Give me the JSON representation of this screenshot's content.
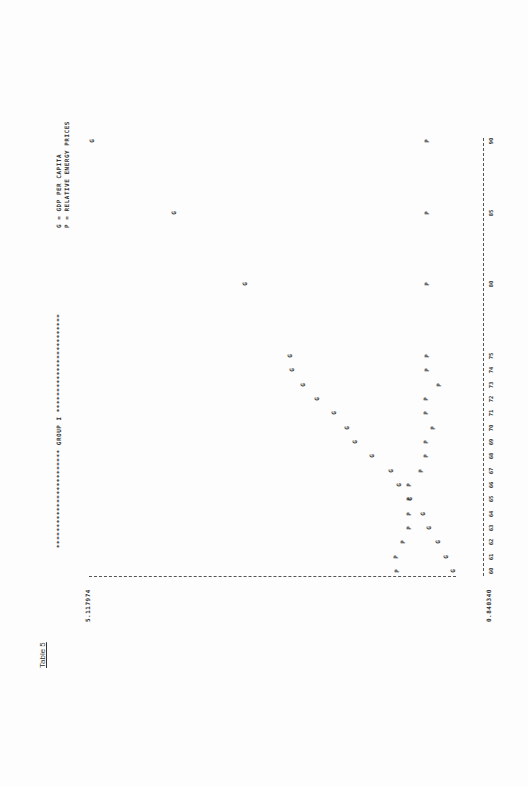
{
  "page": {
    "table_label": "Table 5",
    "banner": "************************ GROUP I ************************",
    "legend": [
      {
        "symbol": "G",
        "text": "G = GDP PER CAPITA"
      },
      {
        "symbol": "P",
        "text": "P = RELATIVE ENERGY PRICES"
      }
    ],
    "y_max_label": "5.117974",
    "y_min_label": "0.840340"
  },
  "chart_data": {
    "type": "scatter",
    "title": "GROUP I",
    "subtitle": "Table 5",
    "xlabel": "Year",
    "ylabel": "",
    "orientation": "rotated 90 degrees (line-printer plot)",
    "ylim": [
      0.84034,
      5.117974
    ],
    "x_tick_labels": [
      "60",
      "61",
      "62",
      "63",
      "64",
      "65",
      "66",
      "67",
      "68",
      "69",
      "70",
      "71",
      "72",
      "73",
      "74",
      "75",
      "80",
      "85",
      "90"
    ],
    "legend": [
      "G = GDP PER CAPITA",
      "P = RELATIVE ENERGY PRICES"
    ],
    "series": [
      {
        "name": "G",
        "label": "GDP PER CAPITA",
        "x": [
          60,
          61,
          62,
          63,
          64,
          65,
          66,
          67,
          68,
          69,
          70,
          71,
          72,
          73,
          74,
          75,
          80,
          85,
          90
        ],
        "values": [
          0.84,
          0.92,
          1.02,
          1.12,
          1.2,
          1.35,
          1.48,
          1.58,
          1.8,
          2.0,
          2.1,
          2.25,
          2.45,
          2.62,
          2.75,
          2.77,
          3.3,
          4.15,
          5.12
        ]
      },
      {
        "name": "P",
        "label": "RELATIVE ENERGY PRICES",
        "x": [
          60,
          61,
          62,
          63,
          64,
          65,
          66,
          67,
          68,
          69,
          70,
          71,
          72,
          73,
          74,
          75,
          80,
          85,
          90
        ],
        "values": [
          1.5,
          1.52,
          1.43,
          1.36,
          1.36,
          1.36,
          1.36,
          1.22,
          1.16,
          1.16,
          1.08,
          1.16,
          1.16,
          1.01,
          1.15,
          1.15,
          1.15,
          1.15,
          1.15
        ]
      }
    ],
    "grid": false
  }
}
